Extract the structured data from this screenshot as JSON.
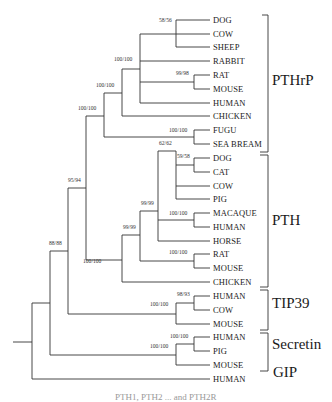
{
  "figure": {
    "type": "phylogenetic-tree",
    "line_color": "#333333",
    "leaves": [
      {
        "label": "DOG",
        "y": 20
      },
      {
        "label": "COW",
        "y": 34
      },
      {
        "label": "SHEEP",
        "y": 47
      },
      {
        "label": "RABBIT",
        "y": 61
      },
      {
        "label": "RAT",
        "y": 75
      },
      {
        "label": "MOUSE",
        "y": 89
      },
      {
        "label": "HUMAN",
        "y": 103
      },
      {
        "label": "CHICKEN",
        "y": 116
      },
      {
        "label": "FUGU",
        "y": 130
      },
      {
        "label": "SEA BREAM",
        "y": 144
      },
      {
        "label": "DOG",
        "y": 158
      },
      {
        "label": "CAT",
        "y": 172
      },
      {
        "label": "COW",
        "y": 186
      },
      {
        "label": "PIG",
        "y": 199
      },
      {
        "label": "MACAQUE",
        "y": 213
      },
      {
        "label": "HUMAN",
        "y": 227
      },
      {
        "label": "HORSE",
        "y": 241
      },
      {
        "label": "RAT",
        "y": 254
      },
      {
        "label": "MOUSE",
        "y": 268
      },
      {
        "label": "CHICKEN",
        "y": 282
      },
      {
        "label": "HUMAN",
        "y": 296
      },
      {
        "label": "COW",
        "y": 310
      },
      {
        "label": "MOUSE",
        "y": 324
      },
      {
        "label": "HUMAN",
        "y": 337
      },
      {
        "label": "PIG",
        "y": 351
      },
      {
        "label": "MOUSE",
        "y": 365
      },
      {
        "label": "HUMAN",
        "y": 379
      }
    ],
    "bootstrap": [
      {
        "label": "58/56",
        "x": 159,
        "y": 23
      },
      {
        "label": "100/100",
        "x": 114,
        "y": 62
      },
      {
        "label": "99/98",
        "x": 176,
        "y": 76
      },
      {
        "label": "100/100",
        "x": 96,
        "y": 88
      },
      {
        "label": "100/100",
        "x": 78,
        "y": 111
      },
      {
        "label": "100/100",
        "x": 169,
        "y": 133
      },
      {
        "label": "59/58",
        "x": 177,
        "y": 159
      },
      {
        "label": "62/62",
        "x": 159,
        "y": 146
      },
      {
        "label": "95/94",
        "x": 68,
        "y": 183
      },
      {
        "label": "99/99",
        "x": 141,
        "y": 206
      },
      {
        "label": "100/100",
        "x": 169,
        "y": 216
      },
      {
        "label": "99/99",
        "x": 123,
        "y": 230
      },
      {
        "label": "88/88",
        "x": 49,
        "y": 246
      },
      {
        "label": "100/100",
        "x": 169,
        "y": 255
      },
      {
        "label": "100/100",
        "x": 83,
        "y": 264
      },
      {
        "label": "98/93",
        "x": 177,
        "y": 297
      },
      {
        "label": "100/100",
        "x": 150,
        "y": 307
      },
      {
        "label": "100/100",
        "x": 170,
        "y": 339
      },
      {
        "label": "100/100",
        "x": 150,
        "y": 349
      }
    ],
    "families": [
      {
        "label": "PTHrP",
        "y": 80
      },
      {
        "label": "PTH",
        "y": 220
      },
      {
        "label": "TIP39",
        "y": 303
      },
      {
        "label": "Secretin",
        "y": 344
      },
      {
        "label": "GIP",
        "y": 372
      }
    ],
    "caption_partial": "PTH1, PTH2 ... and PTH2R"
  }
}
